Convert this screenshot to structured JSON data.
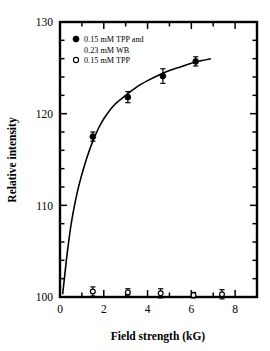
{
  "chart_data": {
    "type": "scatter",
    "title": "",
    "xlabel": "Field strength (kG)",
    "ylabel": "Relative intensity",
    "xlim": [
      0,
      9
    ],
    "ylim": [
      100,
      130
    ],
    "xticks": [
      0,
      1,
      2,
      3,
      4,
      5,
      6,
      7,
      8,
      9
    ],
    "xtick_labels": [
      "0",
      "",
      "2",
      "",
      "4",
      "",
      "6",
      "",
      "8",
      ""
    ],
    "yticks": [
      100,
      102,
      104,
      106,
      108,
      110,
      112,
      114,
      116,
      118,
      120,
      122,
      124,
      126,
      128,
      130
    ],
    "ytick_labels": [
      "100",
      "",
      "",
      "",
      "",
      "110",
      "",
      "",
      "",
      "",
      "120",
      "",
      "",
      "",
      "",
      "130"
    ],
    "grid": false,
    "legend_position": "top-left",
    "series": [
      {
        "name": "0.15 mM TPP and 0.23 mM WB",
        "marker": "filled-circle",
        "color": "#000000",
        "has_fit_curve": true,
        "x": [
          1.5,
          3.1,
          4.7,
          6.2
        ],
        "y": [
          117.5,
          121.8,
          124.1,
          125.7
        ],
        "yerr": [
          0.5,
          0.6,
          0.8,
          0.5
        ]
      },
      {
        "name": "0.15 mM TPP",
        "marker": "open-circle",
        "color": "#000000",
        "has_fit_curve": false,
        "x": [
          1.5,
          3.1,
          4.6,
          6.1,
          7.4
        ],
        "y": [
          100.6,
          100.5,
          100.4,
          100.2,
          100.3
        ],
        "yerr": [
          0.5,
          0.4,
          0.5,
          0.3,
          0.5
        ]
      }
    ],
    "fit_curve": {
      "description": "saturation curve rising steeply from baseline then leveling near 126",
      "points": [
        [
          0.12,
          100.3
        ],
        [
          0.2,
          102.0
        ],
        [
          0.3,
          104.2
        ],
        [
          0.4,
          106.1
        ],
        [
          0.5,
          107.8
        ],
        [
          0.6,
          109.2
        ],
        [
          0.75,
          111.0
        ],
        [
          0.9,
          112.5
        ],
        [
          1.1,
          114.2
        ],
        [
          1.3,
          115.7
        ],
        [
          1.5,
          117.0
        ],
        [
          1.8,
          118.6
        ],
        [
          2.1,
          119.8
        ],
        [
          2.5,
          121.0
        ],
        [
          3.0,
          122.0
        ],
        [
          3.5,
          122.9
        ],
        [
          4.0,
          123.6
        ],
        [
          4.5,
          124.2
        ],
        [
          5.0,
          124.7
        ],
        [
          5.5,
          125.1
        ],
        [
          6.0,
          125.5
        ],
        [
          6.5,
          125.8
        ],
        [
          6.9,
          126.0
        ]
      ]
    }
  },
  "legend": {
    "entries": [
      {
        "marker": "filled-circle",
        "line1": "0.15 mM TPP and",
        "line2": "0.23 mM WB"
      },
      {
        "marker": "open-circle",
        "line1": "0.15 mM TPP",
        "line2": ""
      }
    ]
  },
  "axes": {
    "x_title": "Field strength (kG)",
    "y_title": "Relative intensity",
    "x_labels": [
      "0",
      "2",
      "4",
      "6",
      "8"
    ],
    "y_labels": [
      "100",
      "110",
      "120",
      "130"
    ]
  },
  "colors": {
    "axis": "#000000",
    "marker": "#000000",
    "curve": "#000000",
    "background": "#ffffff"
  }
}
